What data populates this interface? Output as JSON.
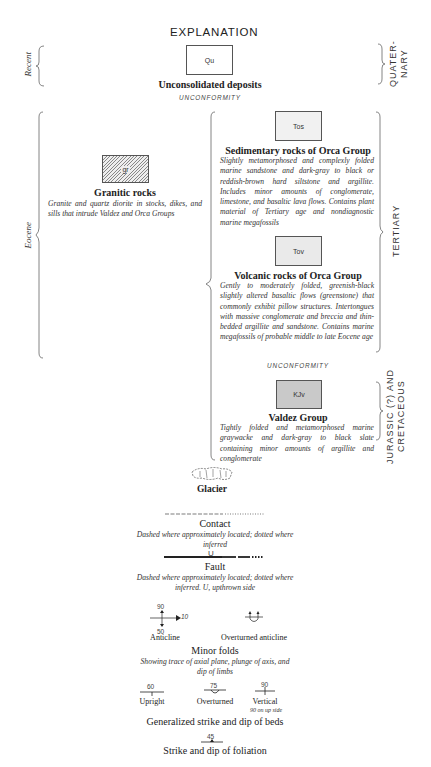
{
  "title": "EXPLANATION",
  "age_labels": {
    "left": {
      "recent": "Recent",
      "eocene": "Eocene"
    },
    "right": {
      "quaternary": "QUATER-\nNARY",
      "tertiary": "TERTIARY",
      "jurassic_cretaceous": "JURASSIC (?) AND\nCRETACEOUS"
    }
  },
  "units": [
    {
      "id": "qu",
      "symbol": "Qu",
      "name": "Unconsolidated deposits",
      "description": "",
      "pattern": "blank"
    },
    {
      "id": "gr",
      "symbol": "gr",
      "name": "Granitic rocks",
      "description": "Granite and quartz diorite in stocks, dikes, and sills that intrude Valdez and Orca Groups",
      "pattern": "diagonal-hatch"
    },
    {
      "id": "tos",
      "symbol": "Tos",
      "name": "Sedimentary rocks of Orca Group",
      "description": "Slightly metamorphosed and complexly folded marine sandstone and dark-gray to black or reddish-brown hard siltstone and argillite. Includes minor amounts of conglomerate, limestone, and basaltic lava flows. Contains plant material of Tertiary age and nondiagnostic marine megafossils",
      "pattern": "stipple"
    },
    {
      "id": "tov",
      "symbol": "Tov",
      "name": "Volcanic rocks of Orca Group",
      "description": "Gently to moderately folded, greenish-black slightly altered basaltic flows (greenstone) that commonly exhibit pillow structures. Intertongues with massive conglomerate and breccia and thin-bedded argillite and sandstone. Contains marine megafossils of probable middle to late Eocene age",
      "pattern": "light-gray"
    },
    {
      "id": "kjv",
      "symbol": "KJv",
      "name": "Valdez Group",
      "description": "Tightly folded and metamorphosed marine graywacke and dark-gray to black slate containing minor amounts of argillite and conglomerate",
      "pattern": "medium-gray"
    }
  ],
  "unconformity_label": "UNCONFORMITY",
  "symbols": {
    "glacier": {
      "name": "Glacier"
    },
    "contact": {
      "name": "Contact",
      "description": "Dashed where approximately located; dotted where inferred"
    },
    "fault": {
      "name": "Fault",
      "marker": "U",
      "description": "Dashed where approximately located; dotted where inferred. U, upthrown side"
    },
    "minor_folds": {
      "name": "Minor folds",
      "description": "Showing trace of axial plane, plunge of axis, and dip of limbs",
      "anticline": {
        "label": "Anticline",
        "dip_top": "90",
        "dip_bottom": "50",
        "plunge": "10"
      },
      "overturned_anticline": {
        "label": "Overturned anticline"
      }
    },
    "beds": {
      "name": "Generalized strike and dip of beds",
      "upright": {
        "label": "Upright",
        "dip": "60"
      },
      "overturned": {
        "label": "Overturned",
        "dip": "75"
      },
      "vertical": {
        "label": "Vertical",
        "dip": "90",
        "note": "90 on up side"
      }
    },
    "foliation": {
      "name": "Strike and dip of foliation",
      "dip": "45"
    }
  },
  "colors": {
    "ink": "#222222",
    "box_border": "#555555",
    "stipple_bg": "#f1f1f1",
    "light_gray": "#eaeaea",
    "medium_gray": "#c9c9c9"
  }
}
